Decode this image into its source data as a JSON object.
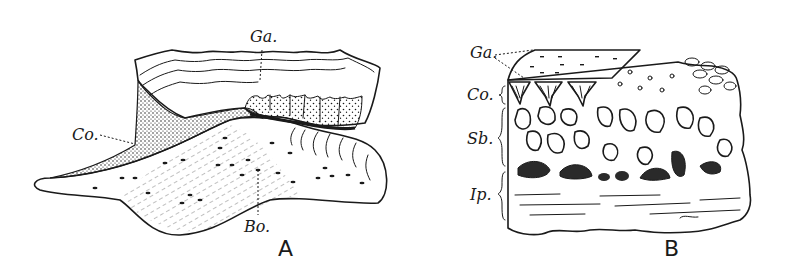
{
  "figure": {
    "panels": [
      {
        "id": "A",
        "letter": "A",
        "labels": {
          "ganoine": "Ga.",
          "cosmine": "Co.",
          "bone": "Bo."
        }
      },
      {
        "id": "B",
        "letter": "B",
        "labels": {
          "ganoine": "Ga.",
          "cosmine": "Co.",
          "spongy_bone": "Sb.",
          "isopedine": "Ip."
        }
      }
    ],
    "colors": {
      "ink": "#1a1a1a",
      "background": "#ffffff"
    }
  }
}
